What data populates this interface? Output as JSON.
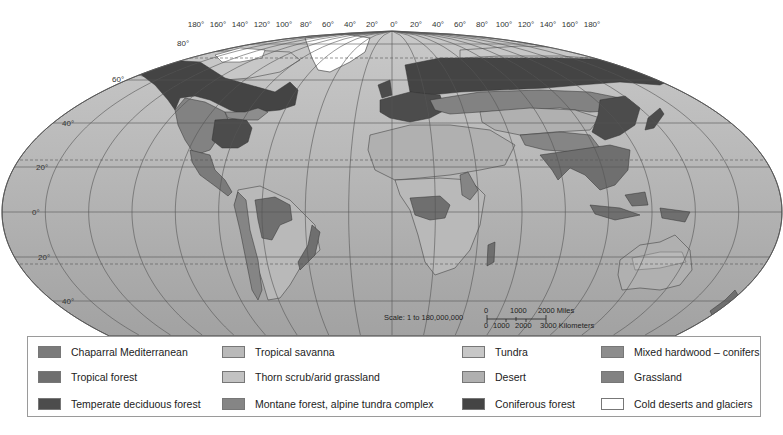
{
  "map": {
    "title": "World biomes",
    "longitude_labels": [
      "180°",
      "160°",
      "140°",
      "120°",
      "100°",
      "80°",
      "60°",
      "40°",
      "20°",
      "0°",
      "20°",
      "40°",
      "60°",
      "80°",
      "100°",
      "120°",
      "140°",
      "160°",
      "180°"
    ],
    "latitude_labels_left": [
      "80°",
      "60°",
      "40°",
      "20°",
      "0°",
      "20°",
      "40°"
    ],
    "scale": {
      "ratio_text": "Scale: 1 to 180,000,000",
      "miles_ticks": [
        "0",
        "1000",
        "2000 Miles"
      ],
      "km_ticks": [
        "0",
        "1000",
        "2000",
        "3000 Kilometers"
      ]
    },
    "colors": {
      "ocean": "#a9a9a9",
      "ocean_light": "#c4c4c4",
      "graticule": "#555555",
      "tropic_dash": "#555555"
    }
  },
  "legend": {
    "items": [
      {
        "label": "Chaparral Mediterranean",
        "color": "#7b7b7b"
      },
      {
        "label": "Tropical forest",
        "color": "#6f6f6f"
      },
      {
        "label": "Temperate deciduous forest",
        "color": "#4c4c4c"
      },
      {
        "label": "Tropical savanna",
        "color": "#b9b9b9"
      },
      {
        "label": "Thorn scrub/arid grassland",
        "color": "#c2c2c2"
      },
      {
        "label": "Montane forest, alpine tundra complex",
        "color": "#858585"
      },
      {
        "label": "Tundra",
        "color": "#c7c7c7"
      },
      {
        "label": "Desert",
        "color": "#b0b0b0"
      },
      {
        "label": "Coniferous forest",
        "color": "#444444"
      },
      {
        "label": "Mixed hardwood – conifers",
        "color": "#8d8d8d"
      },
      {
        "label": "Grassland",
        "color": "#828282"
      },
      {
        "label": "Cold deserts and glaciers",
        "color": "#ffffff"
      }
    ]
  }
}
